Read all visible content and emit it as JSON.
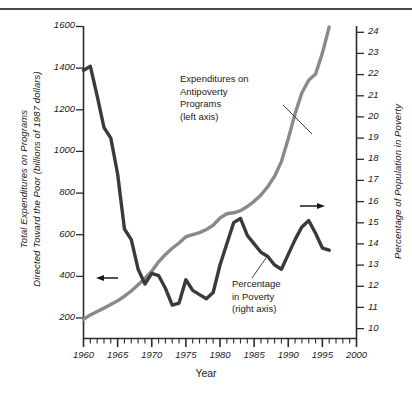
{
  "figure": {
    "title_rule": true,
    "background": "#ffffff"
  },
  "axes": {
    "x": {
      "label": "Year",
      "min": 1960,
      "max": 2000,
      "major_step": 5,
      "minor_step": 1,
      "ticks": [
        "1960",
        "1965",
        "1970",
        "1975",
        "1980",
        "1985",
        "1990",
        "1995",
        "2000"
      ]
    },
    "y_left": {
      "label": "Total Expenditures on Programs Directed Toward the Poor (billions of 1987 dollars)",
      "label_line1": "Total Expenditures on Programs",
      "label_line2": "Directed Toward the Poor (billions of 1987 dollars)",
      "min": 100,
      "max": 1600,
      "step": 200,
      "ticks": [
        "1600",
        "1400",
        "1200",
        "1000",
        "800",
        "600",
        "400",
        "200"
      ]
    },
    "y_right": {
      "label": "Percentage of Population in Poverty",
      "min": 9.5,
      "max": 24.3,
      "step": 1,
      "ticks": [
        "24",
        "23",
        "22",
        "21",
        "20",
        "19",
        "18",
        "17",
        "16",
        "15",
        "14",
        "13",
        "12",
        "11",
        "10"
      ]
    }
  },
  "annotations": [
    {
      "name": "expenditures-label",
      "lines": [
        "Expenditures on",
        "Antipoverty",
        "Programs",
        "(left axis)"
      ],
      "leader_to_series": "expenditures"
    },
    {
      "name": "poverty-label",
      "lines": [
        "Percentage",
        "in Poverty",
        "(right axis)"
      ],
      "leader_to_series": "poverty"
    },
    {
      "name": "left-axis-arrow",
      "glyph": "arrow-left-icon",
      "points_to": "y_left"
    },
    {
      "name": "right-axis-arrow",
      "glyph": "arrow-right-icon",
      "points_to": "y_right"
    }
  ],
  "colors": {
    "expenditures_line": "#8a8a8a",
    "poverty_line": "#3a3a3a",
    "axis": "#2b2b2b",
    "text": "#1a1a1a",
    "rule": "#4a4a4a"
  },
  "chart_data": {
    "type": "line",
    "title": "",
    "xlabel": "Year",
    "ylabel": "Total Expenditures on Programs Directed Toward the Poor (billions of 1987 dollars)",
    "y2label": "Percentage of Population in Poverty",
    "xlim": [
      1960,
      2000
    ],
    "ylim": [
      100,
      1600
    ],
    "y2lim": [
      9.5,
      24.3
    ],
    "grid": false,
    "legend": "inline-annotations",
    "series": [
      {
        "name": "Expenditures on Antipoverty Programs (left axis)",
        "axis": "left",
        "units": "billions of 1987 dollars",
        "color": "#8a8a8a",
        "x": [
          1960,
          1961,
          1962,
          1963,
          1964,
          1965,
          1966,
          1967,
          1968,
          1969,
          1970,
          1971,
          1972,
          1973,
          1974,
          1975,
          1976,
          1977,
          1978,
          1979,
          1980,
          1981,
          1982,
          1983,
          1984,
          1985,
          1986,
          1987,
          1988,
          1989,
          1990,
          1991,
          1992,
          1993,
          1994,
          1995,
          1996
        ],
        "y": [
          195,
          215,
          232,
          248,
          265,
          283,
          305,
          330,
          360,
          390,
          425,
          470,
          505,
          535,
          560,
          590,
          600,
          610,
          625,
          645,
          680,
          700,
          705,
          715,
          735,
          760,
          790,
          830,
          880,
          950,
          1060,
          1180,
          1280,
          1340,
          1370,
          1470,
          1595
        ]
      },
      {
        "name": "Percentage in Poverty (right axis)",
        "axis": "right",
        "units": "percent of population",
        "color": "#3a3a3a",
        "x": [
          1960,
          1961,
          1962,
          1963,
          1964,
          1965,
          1966,
          1967,
          1968,
          1969,
          1970,
          1971,
          1972,
          1973,
          1974,
          1975,
          1976,
          1977,
          1978,
          1979,
          1980,
          1981,
          1982,
          1983,
          1984,
          1985,
          1986,
          1987,
          1988,
          1989,
          1990,
          1991,
          1992,
          1993,
          1994,
          1995,
          1996
        ],
        "y": [
          22.2,
          22.4,
          21.0,
          19.5,
          19.0,
          17.3,
          14.7,
          14.2,
          12.8,
          12.1,
          12.6,
          12.5,
          11.9,
          11.1,
          11.2,
          12.3,
          11.8,
          11.6,
          11.4,
          11.7,
          13.0,
          14.0,
          15.0,
          15.2,
          14.4,
          14.0,
          13.6,
          13.4,
          13.0,
          12.8,
          13.5,
          14.2,
          14.8,
          15.1,
          14.5,
          13.8,
          13.7
        ]
      }
    ]
  }
}
